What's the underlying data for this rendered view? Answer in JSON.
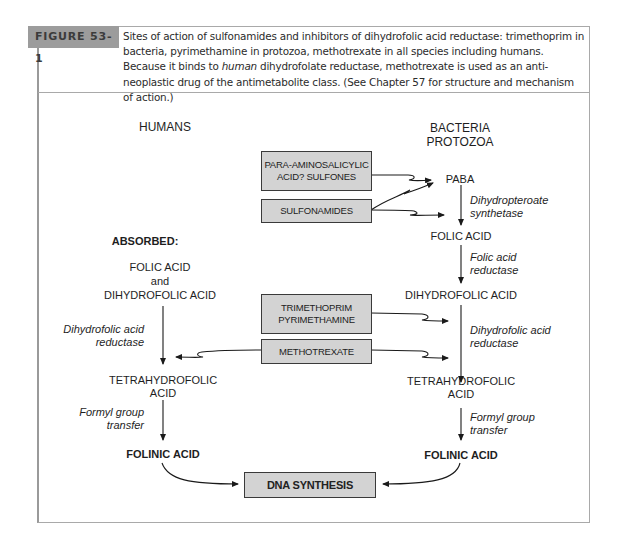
{
  "figure": {
    "label": "FIGURE 53-1",
    "caption_part1": "Sites of action of sulfonamides and inhibitors of dihydrofolic acid reductase: trimethoprim in bacteria, pyrimethamine in protozoa, methotrexate in all species including humans. Because it binds to ",
    "caption_italic": "human",
    "caption_part2": " dihydrofolate reductase, methotrexate is used as an anti-neoplastic drug of the antimetabolite class. (See Chapter 57 for structure and mechanism of action.)"
  },
  "columns": {
    "humans": "HUMANS",
    "bacteria_line1": "BACTERIA",
    "bacteria_line2": "PROTOZOA"
  },
  "humans_pathway": {
    "absorbed": "ABSORBED:",
    "folic_acid": "FOLIC ACID",
    "and": "and",
    "dihydrofolic_acid": "DIHYDROFOLIC ACID",
    "enzyme1_line1": "Dihydrofolic acid",
    "enzyme1_line2": "reductase",
    "thf_line1": "TETRAHYDROFOLIC",
    "thf_line2": "ACID",
    "enzyme2_line1": "Formyl group",
    "enzyme2_line2": "transfer",
    "folinic_acid": "FOLINIC ACID"
  },
  "bacteria_pathway": {
    "paba": "PABA",
    "enzyme1_line1": "Dihydropteroate",
    "enzyme1_line2": "synthetase",
    "folic_acid": "FOLIC ACID",
    "enzyme2_line1": "Folic acid",
    "enzyme2_line2": "reductase",
    "dihydrofolic_acid": "DIHYDROFOLIC ACID",
    "enzyme3_line1": "Dihydrofolic acid",
    "enzyme3_line2": "reductase",
    "thf_line1": "TETRAHYDROFOLIC",
    "thf_line2": "ACID",
    "enzyme4_line1": "Formyl group",
    "enzyme4_line2": "transfer",
    "folinic_acid": "FOLINIC ACID"
  },
  "drugs": {
    "pas_line1": "PARA-AMINOSALICYLIC",
    "pas_line2": "ACID? SULFONES",
    "sulfonamides": "SULFONAMIDES",
    "tmp_line1": "TRIMETHOPRIM",
    "tmp_line2": "PYRIMETHAMINE",
    "methotrexate": "METHOTREXATE"
  },
  "outcome": {
    "dna_synthesis": "DNA SYNTHESIS"
  },
  "colors": {
    "box_fill": "#d3d3d3",
    "figure_tag": "#9c9c9c",
    "frame": "#a9a9a9"
  }
}
